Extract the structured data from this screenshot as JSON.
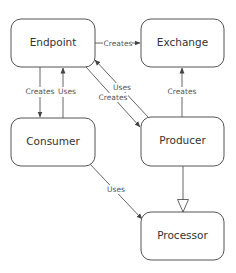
{
  "diagram": {
    "nodes": [
      {
        "id": "endpoint",
        "label": "Endpoint"
      },
      {
        "id": "exchange",
        "label": "Exchange"
      },
      {
        "id": "consumer",
        "label": "Consumer"
      },
      {
        "id": "producer",
        "label": "Producer"
      },
      {
        "id": "processor",
        "label": "Processor"
      }
    ],
    "edges": [
      {
        "from": "endpoint",
        "to": "exchange",
        "label": "Creates"
      },
      {
        "from": "endpoint",
        "to": "consumer",
        "label": "Creates"
      },
      {
        "from": "consumer",
        "to": "endpoint",
        "label": "Uses"
      },
      {
        "from": "producer",
        "to": "endpoint",
        "label": "Uses"
      },
      {
        "from": "endpoint",
        "to": "producer",
        "label": "Creates"
      },
      {
        "from": "producer",
        "to": "exchange",
        "label": "Creates"
      },
      {
        "from": "consumer",
        "to": "processor",
        "label": "Uses"
      },
      {
        "from": "producer",
        "to": "processor",
        "label": "",
        "type": "inheritance"
      }
    ]
  }
}
